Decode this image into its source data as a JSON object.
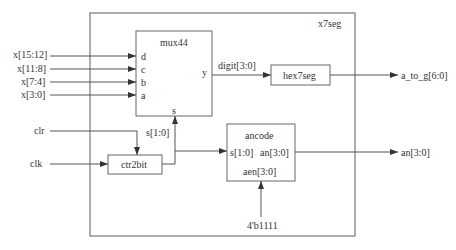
{
  "diagram": {
    "type": "block-diagram",
    "top_module": {
      "name": "x7seg",
      "box": {
        "x": 90,
        "y": 13,
        "w": 265,
        "h": 223
      }
    },
    "blocks": [
      {
        "id": "mux44",
        "label": "mux44",
        "box": {
          "x": 136,
          "y": 31,
          "w": 76,
          "h": 85
        },
        "ports": {
          "inputs": [
            "d",
            "c",
            "b",
            "a"
          ],
          "select": "s",
          "output": "y"
        }
      },
      {
        "id": "hex7seg",
        "label": "hex7seg",
        "box": {
          "x": 271,
          "y": 65,
          "w": 59,
          "h": 20
        }
      },
      {
        "id": "ctr2bit",
        "label": "ctr2bit",
        "box": {
          "x": 108,
          "y": 155,
          "w": 54,
          "h": 19
        }
      },
      {
        "id": "ancode",
        "label": "ancode",
        "box": {
          "x": 227,
          "y": 124,
          "w": 68,
          "h": 57
        },
        "ports": {
          "input": "s[1:0]",
          "output": "an[3:0]",
          "enable": "aen[3:0]"
        }
      }
    ],
    "inputs": [
      {
        "label": "x[15:12]",
        "to": "mux44.d"
      },
      {
        "label": "x[11:8]",
        "to": "mux44.c"
      },
      {
        "label": "x[7:4]",
        "to": "mux44.b"
      },
      {
        "label": "x[3:0]",
        "to": "mux44.a"
      },
      {
        "label": "clr",
        "to": "ctr2bit"
      },
      {
        "label": "clk",
        "to": "ctr2bit"
      }
    ],
    "signals": [
      {
        "label": "digit[3:0]",
        "from": "mux44.y",
        "to": "hex7seg"
      },
      {
        "label": "s[1:0]",
        "from": "ctr2bit",
        "to": [
          "mux44.s",
          "ancode.s[1:0]"
        ]
      },
      {
        "label": "4'b1111",
        "to": "ancode.aen[3:0]"
      }
    ],
    "outputs": [
      {
        "label": "a_to_g[6:0]",
        "from": "hex7seg"
      },
      {
        "label": "an[3:0]",
        "from": "ancode.an[3:0]"
      }
    ]
  },
  "labels": {
    "top_module": "x7seg",
    "mux": "mux44",
    "mux_d": "d",
    "mux_c": "c",
    "mux_b": "b",
    "mux_a": "a",
    "mux_y": "y",
    "mux_s": "s",
    "hex": "hex7seg",
    "ctr": "ctr2bit",
    "ancode": "ancode",
    "ancode_s": "s[1:0]",
    "ancode_an": "an[3:0]",
    "ancode_aen": "aen[3:0]",
    "in_x3": "x[15:12]",
    "in_x2": "x[11:8]",
    "in_x1": "x[7:4]",
    "in_x0": "x[3:0]",
    "in_clr": "clr",
    "in_clk": "clk",
    "sig_digit": "digit[3:0]",
    "sig_s": "s[1:0]",
    "sig_const": "4'b1111",
    "out_atog": "a_to_g[6:0]",
    "out_an": "an[3:0]"
  }
}
